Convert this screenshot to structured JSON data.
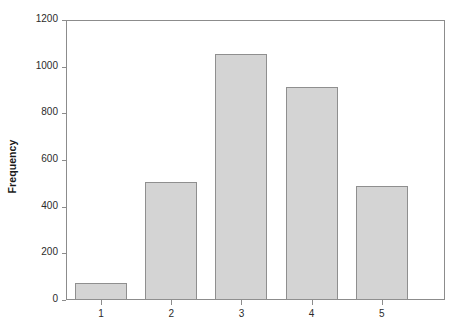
{
  "chart_data": {
    "type": "bar",
    "title": "",
    "subtitle": "",
    "xlabel": "",
    "ylabel": "Frequency",
    "categories": [
      "1",
      "2",
      "3",
      "4",
      "5"
    ],
    "values": [
      73,
      506,
      1054,
      913,
      489
    ],
    "series": [
      {
        "name": "Frequency",
        "values": [
          73,
          506,
          1054,
          913,
          489
        ]
      }
    ],
    "xlim": [
      0.5,
      5.9
    ],
    "ylim": [
      0,
      1200
    ],
    "y_ticks": [
      0,
      200,
      400,
      600,
      800,
      1000,
      1200
    ],
    "y_tick_labels": [
      "0",
      "200",
      "400",
      "600",
      "800",
      "1000",
      "1200"
    ],
    "x_ticks": [
      1,
      2,
      3,
      4,
      5
    ],
    "x_tick_labels": [
      "1",
      "2",
      "3",
      "4",
      "5"
    ],
    "grid": false,
    "legend": false,
    "legend_position": "none",
    "annotations": [],
    "colors": {
      "bar_fill": "#d4d4d4",
      "bar_border": "#8f8f8f",
      "axis": "#8c8c8c",
      "text": "#2b2b2b",
      "title_text": "#1a1a1a",
      "background": "#ffffff"
    }
  }
}
